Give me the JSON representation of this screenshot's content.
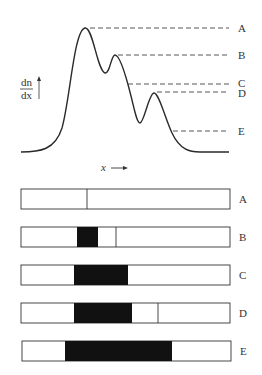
{
  "figure": {
    "y_axis_label": {
      "numerator": "dn",
      "denominator": "dx"
    },
    "x_axis_label": "x",
    "levels": [
      {
        "id": "A",
        "label": "A",
        "y": 28,
        "x_start": 90
      },
      {
        "id": "B",
        "label": "B",
        "y": 55,
        "x_start": 118
      },
      {
        "id": "C",
        "label": "C",
        "y": 84,
        "x_start": 128
      },
      {
        "id": "D",
        "label": "D",
        "y": 92,
        "x_start": 157
      },
      {
        "id": "E",
        "label": "E",
        "y": 131,
        "x_start": 173
      }
    ],
    "bars": [
      {
        "id": "A",
        "label": "A",
        "top": 189,
        "black": null,
        "divider": 87
      },
      {
        "id": "B",
        "label": "B",
        "top": 227,
        "black": [
          77,
          98
        ],
        "divider": 116
      },
      {
        "id": "C",
        "label": "C",
        "top": 265,
        "black": [
          74,
          128
        ],
        "divider": null
      },
      {
        "id": "D",
        "label": "D",
        "top": 303,
        "black": [
          74,
          132
        ],
        "divider": 158
      },
      {
        "id": "E",
        "label": "E",
        "top": 341,
        "black": [
          65,
          172
        ],
        "divider": null
      }
    ]
  },
  "colors": {
    "line": "#2a2a2a",
    "fill": "#111111",
    "dash": "#444444"
  }
}
